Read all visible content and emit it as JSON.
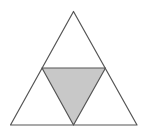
{
  "diagram": {
    "colors": {
      "background": "#ffffff",
      "stroke": "#555555",
      "shaded_fill": "#c8c8c8"
    },
    "outer_triangle": {
      "apex": [
        73.5,
        11.5
      ],
      "bottom_left": [
        10.5,
        125
      ],
      "bottom_right": [
        137,
        125
      ]
    },
    "inner_triangle": {
      "left_mid": [
        42,
        68
      ],
      "right_mid": [
        105.5,
        68
      ],
      "bottom_mid": [
        73.5,
        125
      ],
      "shaded": true
    }
  }
}
